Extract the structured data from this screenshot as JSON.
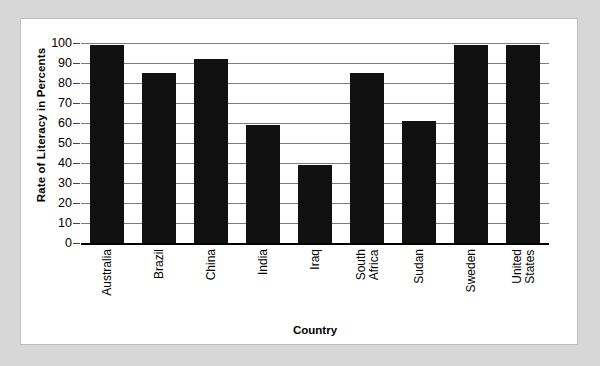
{
  "chart_data": {
    "type": "bar",
    "title": "",
    "xlabel": "Country",
    "ylabel": "Rate of Literacy in Percents",
    "categories": [
      "Australia",
      "Brazil",
      "China",
      "India",
      "Iraq",
      "South Africa",
      "Sudan",
      "Sweden",
      "United States"
    ],
    "category_lines": [
      [
        "Australia"
      ],
      [
        "Brazil"
      ],
      [
        "China"
      ],
      [
        "India"
      ],
      [
        "Iraq"
      ],
      [
        "South",
        "Africa"
      ],
      [
        "Sudan"
      ],
      [
        "Sweden"
      ],
      [
        "United",
        "States"
      ]
    ],
    "values": [
      99,
      85,
      92,
      59,
      39,
      85,
      61,
      99,
      99
    ],
    "ylim": [
      0,
      100
    ],
    "yticks": [
      100,
      90,
      80,
      70,
      60,
      50,
      40,
      30,
      20,
      10,
      0
    ],
    "ytick_labels": [
      "100",
      "90",
      "80",
      "70",
      "60",
      "50",
      "40",
      "30",
      "20",
      "10",
      "0"
    ],
    "grid": true,
    "legend": false,
    "bar_color": "#111111",
    "gridline_color": "#7d7d7d",
    "axis_color": "#000000",
    "plot_background": "#ffffff",
    "page_background": "#d7d7d7"
  }
}
